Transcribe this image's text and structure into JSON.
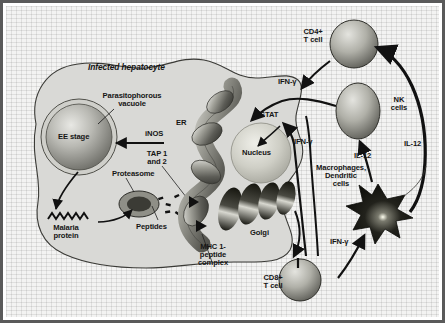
{
  "figure": {
    "border_color": "#5a5a5a",
    "background_color": "#f3f3f2",
    "cell_fill_color": "#d9d9d6",
    "arrow_color": "#111111"
  },
  "labels": {
    "infected_hepatocyte": "Infected hepatocyte",
    "parasitophorous_vacuole": "Parasitophorous\nvacuole",
    "ee_stage": "EE stage",
    "inos": "iNOS",
    "tap": "TAP 1\nand 2",
    "proteasome": "Proteasome",
    "malaria_protein": "Malaria\nprotein",
    "peptides": "Peptides",
    "er": "ER",
    "nucleus": "Nucleus",
    "stat": "STAT",
    "golgi": "Golgi",
    "mhc_complex": "MHC 1-\npeptide\ncomplex",
    "cd8_t_cell": "CD8+\nT cell",
    "cd4_t_cell": "CD4+\nT cell",
    "nk_cells": "NK\ncells",
    "macrophages_dendritic": "Macrophages,\nDendritic\ncells",
    "ifn_gamma_nk_to_cell": "IFN-γ",
    "ifn_gamma_cd4": "IFN-γ",
    "ifn_gamma_cd8_to_mac": "IFN-γ",
    "il12_to_nk": "IL-12",
    "il12_to_cd4": "IL-12"
  }
}
